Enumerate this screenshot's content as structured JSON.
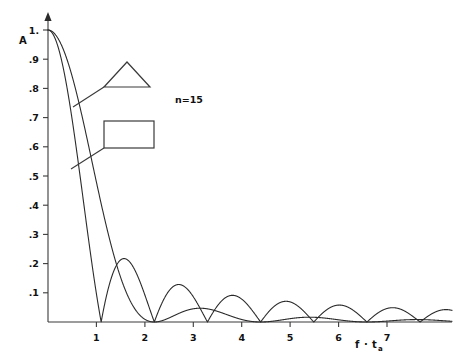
{
  "chart_data": {
    "type": "line",
    "title": "",
    "subtitle": "",
    "xlabel": "f · t_a",
    "ylabel": "A",
    "xlim": [
      0,
      7.6
    ],
    "ylim": [
      0,
      1.04
    ],
    "grid": false,
    "legend_position": "inside-upper-left",
    "annotations": [
      {
        "name": "order-label",
        "text": "n=15",
        "x": 3.0,
        "y": 0.72
      }
    ],
    "xticks": [
      1,
      2,
      3,
      4,
      5,
      6,
      7
    ],
    "xtick_labels": [
      "1",
      "2",
      "3",
      "4",
      "5",
      "6",
      "7"
    ],
    "yticks": [
      0.1,
      0.2,
      0.3,
      0.4,
      0.5,
      0.6,
      0.7,
      0.8,
      0.9,
      1.0
    ],
    "ytick_labels": [
      ".1",
      ".2",
      ".3",
      ".4",
      ".5",
      ".6",
      ".7",
      ".8",
      ".9",
      "1."
    ],
    "series": [
      {
        "name": "rectangular-window",
        "legend_glyph": "rectangle",
        "formula": "|sin(pi x)/(pi x)|",
        "zeros": [
          1,
          2,
          3,
          4,
          5,
          6,
          7
        ],
        "peaks": [
          {
            "x": 0.0,
            "y": 1.0
          },
          {
            "x": 1.43,
            "y": 0.217
          },
          {
            "x": 2.46,
            "y": 0.128
          },
          {
            "x": 3.47,
            "y": 0.091
          },
          {
            "x": 4.48,
            "y": 0.071
          },
          {
            "x": 5.48,
            "y": 0.058
          },
          {
            "x": 6.48,
            "y": 0.049
          }
        ]
      },
      {
        "name": "triangular-window",
        "legend_glyph": "triangle",
        "formula": "(sin(pi x/2)/(pi x/2))^2",
        "zeros": [
          2,
          4,
          6
        ],
        "peaks": [
          {
            "x": 0.0,
            "y": 1.0
          },
          {
            "x": 2.86,
            "y": 0.047
          },
          {
            "x": 4.92,
            "y": 0.016
          },
          {
            "x": 6.94,
            "y": 0.008
          }
        ]
      }
    ]
  },
  "axes": {
    "y_axis_label": "A",
    "x_axis_label_main": "f",
    "x_axis_label_dot": "·",
    "x_axis_label_var": "t",
    "x_axis_label_sub": "a",
    "ytick_labels": [
      {
        "value": "1.",
        "pos": 1.0
      },
      {
        "value": ".9",
        "pos": 0.9
      },
      {
        "value": ".8",
        "pos": 0.8
      },
      {
        "value": ".7",
        "pos": 0.7
      },
      {
        "value": ".6",
        "pos": 0.6
      },
      {
        "value": ".5",
        "pos": 0.5
      },
      {
        "value": ".4",
        "pos": 0.4
      },
      {
        "value": ".3",
        "pos": 0.3
      },
      {
        "value": ".2",
        "pos": 0.2
      },
      {
        "value": ".1",
        "pos": 0.1
      }
    ],
    "xtick_labels": [
      {
        "value": "1",
        "pos": 1
      },
      {
        "value": "2",
        "pos": 2
      },
      {
        "value": "3",
        "pos": 3
      },
      {
        "value": "4",
        "pos": 4
      },
      {
        "value": "5",
        "pos": 5
      },
      {
        "value": "6",
        "pos": 6
      },
      {
        "value": "7",
        "pos": 7
      }
    ]
  },
  "legend": {
    "triangle_label": "triangular-window-glyph",
    "rectangle_label": "rectangular-window-glyph",
    "order_text": "n=15"
  },
  "colors": {
    "curve": "#2b2b2b",
    "axis": "#3a3a3a",
    "text": "#111111",
    "background": "#ffffff"
  }
}
